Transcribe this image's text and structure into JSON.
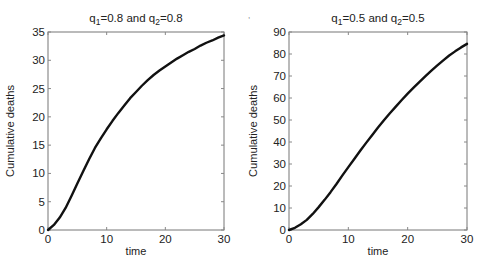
{
  "chart_data": [
    {
      "type": "line",
      "title": "q1=0.8 and q2=0.8",
      "title_parts": {
        "q1_label": "q",
        "q1_sub": "1",
        "q1_value": "=0.8 and ",
        "q2_label": "q",
        "q2_sub": "2",
        "q2_value": "=0.8"
      },
      "xlabel": "time",
      "ylabel": "Cumulative deaths",
      "xlim": [
        0,
        30
      ],
      "ylim": [
        0,
        35
      ],
      "xticks": [
        0,
        10,
        20,
        30
      ],
      "yticks": [
        0,
        5,
        10,
        15,
        20,
        25,
        30,
        35
      ],
      "grid": false,
      "legend": null,
      "series": [
        {
          "name": "Cumulative deaths",
          "color": "#111111",
          "x": [
            0,
            1,
            2,
            3,
            4,
            5,
            6,
            7,
            8,
            9,
            10,
            11,
            12,
            13,
            14,
            15,
            16,
            17,
            18,
            19,
            20,
            21,
            22,
            23,
            24,
            25,
            26,
            27,
            28,
            29,
            30
          ],
          "y": [
            0,
            0.9,
            2.2,
            3.9,
            6.0,
            8.2,
            10.4,
            12.5,
            14.5,
            16.2,
            17.8,
            19.3,
            20.7,
            22.0,
            23.3,
            24.4,
            25.5,
            26.5,
            27.4,
            28.2,
            28.9,
            29.6,
            30.3,
            30.9,
            31.5,
            32.0,
            32.6,
            33.1,
            33.5,
            34.0,
            34.4
          ]
        }
      ]
    },
    {
      "type": "line",
      "title": "q1=0.5 and q2=0.5",
      "title_parts": {
        "q1_label": "q",
        "q1_sub": "1",
        "q1_value": "=0.5 and ",
        "q2_label": "q",
        "q2_sub": "2",
        "q2_value": "=0.5"
      },
      "xlabel": "time",
      "ylabel": "Cumulative deaths",
      "xlim": [
        0,
        30
      ],
      "ylim": [
        0,
        90
      ],
      "xticks": [
        0,
        10,
        20,
        30
      ],
      "yticks": [
        0,
        10,
        20,
        30,
        40,
        50,
        60,
        70,
        80,
        90
      ],
      "grid": false,
      "legend": null,
      "series": [
        {
          "name": "Cumulative deaths",
          "color": "#111111",
          "x": [
            0,
            1,
            2,
            3,
            4,
            5,
            6,
            7,
            8,
            9,
            10,
            11,
            12,
            13,
            14,
            15,
            16,
            17,
            18,
            19,
            20,
            21,
            22,
            23,
            24,
            25,
            26,
            27,
            28,
            29,
            30
          ],
          "y": [
            0,
            1.0,
            2.6,
            4.6,
            7.3,
            10.4,
            13.7,
            17.2,
            20.9,
            24.8,
            28.6,
            32.3,
            36.0,
            39.6,
            43.1,
            46.6,
            49.9,
            53.1,
            56.1,
            59.1,
            62.0,
            64.7,
            67.3,
            69.9,
            72.4,
            74.8,
            77.1,
            79.3,
            81.2,
            83.0,
            84.6
          ]
        }
      ]
    }
  ],
  "plots": [
    {
      "title_q1": "q",
      "title_sub1": "1",
      "title_mid": "=0.8 and ",
      "title_q2": "q",
      "title_sub2": "2",
      "title_end": "=0.8",
      "xlabel": "time",
      "ylabel": "Cumulative deaths",
      "xticks": [
        "0",
        "10",
        "20",
        "30"
      ],
      "yticks": [
        "0",
        "5",
        "10",
        "15",
        "20",
        "25",
        "30",
        "35"
      ]
    },
    {
      "title_q1": "q",
      "title_sub1": "1",
      "title_mid": "=0.5 and ",
      "title_q2": "q",
      "title_sub2": "2",
      "title_end": "=0.5",
      "xlabel": "time",
      "ylabel": "Cumulative deaths",
      "xticks": [
        "0",
        "10",
        "20",
        "30"
      ],
      "yticks": [
        "0",
        "10",
        "20",
        "30",
        "40",
        "50",
        "60",
        "70",
        "80",
        "90"
      ]
    }
  ]
}
